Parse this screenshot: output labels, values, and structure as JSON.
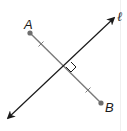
{
  "diagram": {
    "type": "perpendicular-bisector",
    "segment": {
      "name": "AB",
      "endpoints": [
        {
          "label": "A",
          "x": 30,
          "y": 33
        },
        {
          "label": "B",
          "x": 101,
          "y": 103
        }
      ],
      "congruence_ticks": 2,
      "color": "#7a7a7a"
    },
    "line": {
      "label": "ℓ",
      "from": {
        "x": 8,
        "y": 118
      },
      "to": {
        "x": 114,
        "y": 18
      },
      "arrows": "both",
      "color": "#1a1a1a"
    },
    "intersection": {
      "x": 66,
      "y": 67,
      "right_angle_marker": true
    }
  },
  "labels": {
    "point_a": "A",
    "point_b": "B",
    "line_l": "ℓ"
  }
}
